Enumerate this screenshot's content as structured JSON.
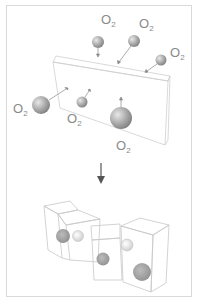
{
  "diagram": {
    "type": "process-illustration",
    "top_panel": {
      "labels": [
        {
          "id": "o2-1",
          "text": "O",
          "sub": "2",
          "x": 101,
          "y": 24
        },
        {
          "id": "o2-2",
          "text": "O",
          "sub": "2",
          "x": 139,
          "y": 28
        },
        {
          "id": "o2-3",
          "text": "O",
          "sub": "2",
          "x": 170,
          "y": 57
        },
        {
          "id": "o2-4",
          "text": "O",
          "sub": "2",
          "x": 14,
          "y": 113
        },
        {
          "id": "o2-5",
          "text": "O",
          "sub": "2",
          "x": 68,
          "y": 123
        },
        {
          "id": "o2-6",
          "text": "O",
          "sub": "2",
          "x": 117,
          "y": 150
        }
      ],
      "molecules": [
        {
          "cx": 98,
          "cy": 42,
          "r": 6
        },
        {
          "cx": 134,
          "cy": 41,
          "r": 6
        },
        {
          "cx": 161,
          "cy": 60,
          "r": 5.5
        },
        {
          "cx": 41,
          "cy": 105,
          "r": 9
        },
        {
          "cx": 82,
          "cy": 102,
          "r": 5.5
        },
        {
          "cx": 121,
          "cy": 118,
          "r": 11
        }
      ]
    },
    "arrow": {
      "direction": "down",
      "meaning": "transition"
    },
    "bottom_panel": {
      "pieces": 4,
      "bubbles": 5
    }
  }
}
